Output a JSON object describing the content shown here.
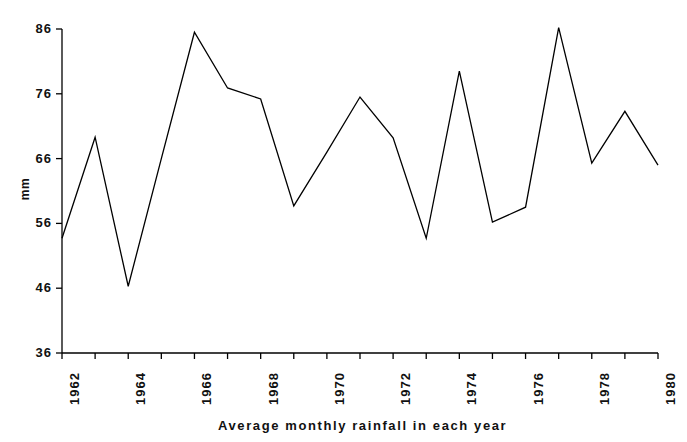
{
  "chart_data": {
    "type": "line",
    "title": "Average monthly rainfall in each year",
    "xlabel": "",
    "ylabel": "mm",
    "x": [
      1962,
      1963,
      1964,
      1965,
      1966,
      1967,
      1968,
      1969,
      1970,
      1971,
      1972,
      1973,
      1974,
      1975,
      1976,
      1977,
      1978,
      1979,
      1980
    ],
    "values": [
      53.7,
      69.3,
      46.3,
      66.0,
      85.5,
      76.9,
      75.2,
      58.7,
      67.0,
      75.5,
      69.2,
      53.7,
      79.5,
      56.2,
      58.5,
      86.2,
      65.3,
      73.3,
      65.0
    ],
    "series": [
      {
        "name": "Average monthly rainfall",
        "values": [
          53.7,
          69.3,
          46.3,
          66.0,
          85.5,
          76.9,
          75.2,
          58.7,
          67.0,
          75.5,
          69.2,
          53.7,
          79.5,
          56.2,
          58.5,
          86.2,
          65.3,
          73.3,
          65.0
        ]
      }
    ],
    "xlim": [
      1962,
      1980
    ],
    "ylim": [
      36,
      86
    ],
    "yticks": [
      36,
      46,
      56,
      66,
      76,
      86
    ],
    "ytick_labels": [
      "36",
      "46",
      "56",
      "66",
      "76",
      "86"
    ],
    "xticks": [
      1962,
      1963,
      1964,
      1965,
      1966,
      1967,
      1968,
      1969,
      1970,
      1971,
      1972,
      1973,
      1974,
      1975,
      1976,
      1977,
      1978,
      1979,
      1980
    ],
    "xtick_labels": [
      "1962",
      "",
      "1964",
      "",
      "1966",
      "",
      "1968",
      "",
      "1970",
      "",
      "1972",
      "",
      "1974",
      "",
      "1976",
      "",
      "1978",
      "",
      "1980"
    ],
    "grid": false,
    "legend": false,
    "line_color": "#000000",
    "axis_color": "#000000",
    "background_color": "#ffffff"
  }
}
